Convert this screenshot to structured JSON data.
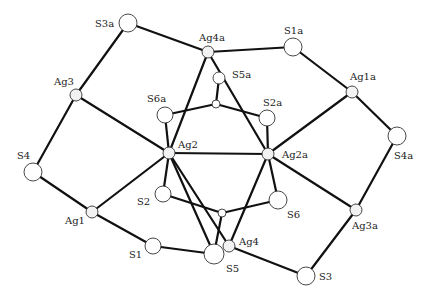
{
  "diagram": {
    "type": "molecular-structure",
    "atoms": [
      {
        "id": "S3a",
        "label": "S3a",
        "x": 128,
        "y": 23,
        "r": 9,
        "el": "S",
        "lx": 95,
        "ly": 27
      },
      {
        "id": "Ag4a",
        "label": "Ag4a",
        "x": 208,
        "y": 52,
        "r": 6,
        "el": "Ag",
        "lx": 199,
        "ly": 41
      },
      {
        "id": "S1a",
        "label": "S1a",
        "x": 293,
        "y": 47,
        "r": 9,
        "el": "S",
        "lx": 284,
        "ly": 34
      },
      {
        "id": "Ag3",
        "label": "Ag3",
        "x": 76,
        "y": 95,
        "r": 6,
        "el": "Ag",
        "lx": 54,
        "ly": 85
      },
      {
        "id": "S5a",
        "label": "S5a",
        "x": 219,
        "y": 78,
        "r": 6,
        "el": "S",
        "lx": 232,
        "ly": 78
      },
      {
        "id": "Ctop",
        "label": "",
        "x": 216,
        "y": 104,
        "r": 4,
        "el": "C"
      },
      {
        "id": "S6a",
        "label": "S6a",
        "x": 165,
        "y": 115,
        "r": 8,
        "el": "S",
        "lx": 147,
        "ly": 102
      },
      {
        "id": "S2a",
        "label": "S2a",
        "x": 267,
        "y": 118,
        "r": 8,
        "el": "S",
        "lx": 263,
        "ly": 106
      },
      {
        "id": "Ag1a",
        "label": "Ag1a",
        "x": 352,
        "y": 92,
        "r": 6,
        "el": "Ag",
        "lx": 350,
        "ly": 80
      },
      {
        "id": "S4",
        "label": "S4",
        "x": 33,
        "y": 172,
        "r": 9,
        "el": "S",
        "lx": 17,
        "ly": 159
      },
      {
        "id": "Ag2",
        "label": "Ag2",
        "x": 169,
        "y": 153,
        "r": 6,
        "el": "Ag",
        "lx": 178,
        "ly": 148
      },
      {
        "id": "Ag2a",
        "label": "Ag2a",
        "x": 268,
        "y": 154,
        "r": 6,
        "el": "Ag",
        "lx": 282,
        "ly": 158
      },
      {
        "id": "S4a",
        "label": "S4a",
        "x": 397,
        "y": 136,
        "r": 9,
        "el": "S",
        "lx": 394,
        "ly": 159
      },
      {
        "id": "S2",
        "label": "S2",
        "x": 163,
        "y": 194,
        "r": 8,
        "el": "S",
        "lx": 137,
        "ly": 205
      },
      {
        "id": "S6",
        "label": "S6",
        "x": 278,
        "y": 200,
        "r": 9,
        "el": "S",
        "lx": 287,
        "ly": 218
      },
      {
        "id": "Cbot",
        "label": "",
        "x": 222,
        "y": 213,
        "r": 4,
        "el": "C"
      },
      {
        "id": "Ag1",
        "label": "Ag1",
        "x": 92,
        "y": 212,
        "r": 6,
        "el": "Ag",
        "lx": 65,
        "ly": 224
      },
      {
        "id": "Ag3a",
        "label": "Ag3a",
        "x": 356,
        "y": 210,
        "r": 6,
        "el": "Ag",
        "lx": 352,
        "ly": 229
      },
      {
        "id": "S1",
        "label": "S1",
        "x": 153,
        "y": 246,
        "r": 8,
        "el": "S",
        "lx": 129,
        "ly": 258
      },
      {
        "id": "Ag4",
        "label": "Ag4",
        "x": 229,
        "y": 246,
        "r": 6,
        "el": "Ag",
        "lx": 239,
        "ly": 245
      },
      {
        "id": "S5",
        "label": "S5",
        "x": 214,
        "y": 254,
        "r": 10,
        "el": "S",
        "lx": 226,
        "ly": 272
      },
      {
        "id": "S3",
        "label": "S3",
        "x": 306,
        "y": 276,
        "r": 9,
        "el": "S",
        "lx": 319,
        "ly": 280
      }
    ],
    "bonds": [
      [
        "S3a",
        "Ag4a"
      ],
      [
        "S3a",
        "Ag3"
      ],
      [
        "Ag4a",
        "S1a"
      ],
      [
        "S1a",
        "Ag1a"
      ],
      [
        "Ag1a",
        "S4a"
      ],
      [
        "Ag1a",
        "Ag2a"
      ],
      [
        "S4a",
        "Ag3a"
      ],
      [
        "Ag3a",
        "Ag2a"
      ],
      [
        "Ag3a",
        "S3"
      ],
      [
        "S3",
        "Ag4"
      ],
      [
        "Ag3",
        "S4"
      ],
      [
        "Ag3",
        "Ag2"
      ],
      [
        "S4",
        "Ag1"
      ],
      [
        "Ag1",
        "Ag2"
      ],
      [
        "Ag1",
        "S1"
      ],
      [
        "S1",
        "S5"
      ],
      [
        "Ag4a",
        "Ag2"
      ],
      [
        "Ag4a",
        "Ag2a"
      ],
      [
        "Ag2",
        "Ag2a"
      ],
      [
        "S5a",
        "Ctop"
      ],
      [
        "S6a",
        "Ctop"
      ],
      [
        "S2a",
        "Ctop"
      ],
      [
        "S6a",
        "Ag2"
      ],
      [
        "S2a",
        "Ag2a"
      ],
      [
        "Ag2",
        "S2"
      ],
      [
        "Ag2",
        "Ag4"
      ],
      [
        "Ag2a",
        "S6"
      ],
      [
        "Ag2a",
        "Ag4"
      ],
      [
        "S2",
        "Cbot"
      ],
      [
        "S6",
        "Cbot"
      ],
      [
        "Cbot",
        "S5"
      ],
      [
        "Ag2",
        "S5"
      ]
    ]
  }
}
